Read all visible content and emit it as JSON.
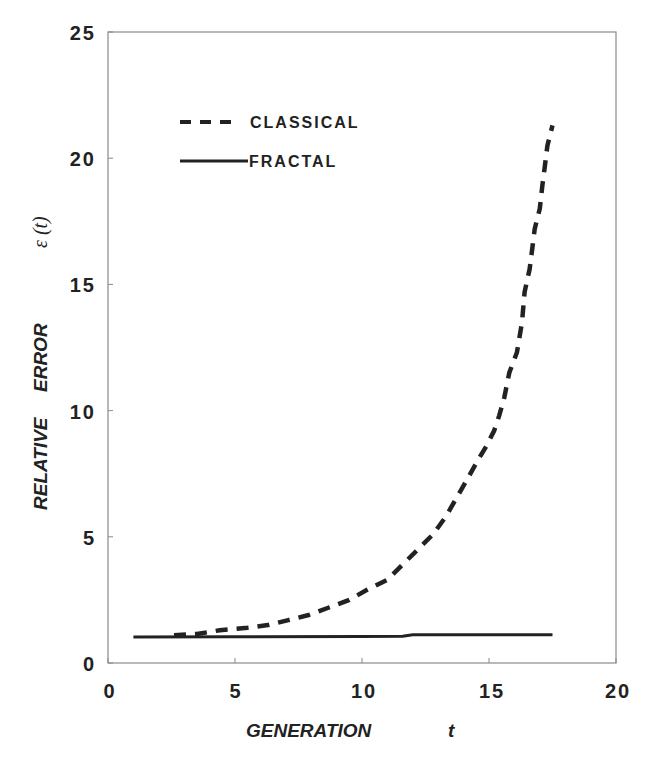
{
  "chart_data": {
    "type": "line",
    "title": "",
    "xlabel": "GENERATION t",
    "ylabel": "RELATIVE ERROR ε (t)",
    "xlim": [
      0,
      20
    ],
    "ylim": [
      0,
      25
    ],
    "x_ticks": [
      0,
      5,
      10,
      15,
      20
    ],
    "y_ticks": [
      0,
      5,
      10,
      15,
      20,
      25
    ],
    "grid": false,
    "legend_position": "upper-left",
    "series": [
      {
        "name": "CLASSICAL",
        "style": "dashed",
        "color": "#222222",
        "x": [
          2.6,
          3.5,
          4.4,
          5.5,
          6.3,
          7.1,
          7.9,
          8.7,
          9.5,
          10.2,
          11.0,
          11.6,
          12.2,
          12.8,
          13.3,
          13.7,
          14.1,
          14.6,
          14.9,
          15.2,
          15.4,
          15.6,
          15.8,
          16.1,
          16.3,
          16.4,
          16.6,
          16.7,
          16.8,
          17.0,
          17.1,
          17.2,
          17.3,
          17.5
        ],
        "y": [
          1.1,
          1.15,
          1.3,
          1.4,
          1.5,
          1.7,
          1.9,
          2.2,
          2.5,
          2.9,
          3.3,
          3.9,
          4.5,
          5.1,
          5.8,
          6.5,
          7.2,
          8.1,
          8.6,
          9.2,
          9.8,
          10.5,
          11.5,
          12.3,
          13.5,
          14.7,
          15.6,
          16.4,
          17.2,
          18.0,
          18.9,
          19.7,
          20.5,
          21.3
        ]
      },
      {
        "name": "FRACTAL",
        "style": "solid",
        "color": "#222222",
        "x": [
          1.0,
          5.0,
          10.0,
          11.6,
          12.0,
          15.0,
          17.5
        ],
        "y": [
          1.03,
          1.04,
          1.05,
          1.06,
          1.12,
          1.12,
          1.12
        ]
      }
    ]
  },
  "axes": {
    "x_tick_labels": [
      "0",
      "5",
      "10",
      "15",
      "20"
    ],
    "y_tick_labels": [
      "0",
      "5",
      "10",
      "15",
      "20",
      "25"
    ],
    "x_title_main": "GENERATION",
    "x_title_var": "t",
    "y_title_words": [
      "RELATIVE",
      "ERROR"
    ],
    "y_title_symbol": "ε (t)"
  },
  "legend": {
    "items": [
      {
        "label": "CLASSICAL",
        "style": "dashed"
      },
      {
        "label": "FRACTAL",
        "style": "solid"
      }
    ]
  }
}
